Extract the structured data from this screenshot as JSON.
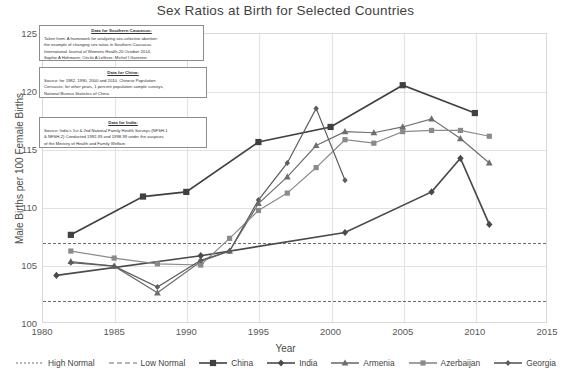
{
  "chart_data": {
    "type": "line",
    "title": "Sex Ratios at Birth for Selected Countries",
    "xlabel": "Year",
    "ylabel": "Male Births per 100 Female Births",
    "xlim": [
      1980,
      2015
    ],
    "ylim": [
      100,
      125
    ],
    "xticks": [
      1980,
      1985,
      1990,
      1995,
      2000,
      2005,
      2010,
      2015
    ],
    "yticks": [
      100,
      105,
      110,
      115,
      120,
      125
    ],
    "grid": true,
    "legend_position": "bottom",
    "reference_lines": [
      {
        "name": "High Normal",
        "value": 107,
        "style": "dotted"
      },
      {
        "name": "Low Normal",
        "value": 102,
        "style": "dashed"
      }
    ],
    "series": [
      {
        "name": "China",
        "marker": "square",
        "color": "#404040",
        "points": [
          {
            "x": 1982,
            "y": 107.6
          },
          {
            "x": 1987,
            "y": 110.9
          },
          {
            "x": 1990,
            "y": 111.3
          },
          {
            "x": 1995,
            "y": 115.6
          },
          {
            "x": 2000,
            "y": 116.9
          },
          {
            "x": 2005,
            "y": 120.5
          },
          {
            "x": 2010,
            "y": 118.1
          }
        ]
      },
      {
        "name": "India",
        "marker": "diamond",
        "color": "#4a4a4a",
        "points": [
          {
            "x": 1981,
            "y": 104.1
          },
          {
            "x": 1991,
            "y": 105.8
          },
          {
            "x": 2001,
            "y": 107.8
          },
          {
            "x": 2007,
            "y": 111.3
          },
          {
            "x": 2009,
            "y": 114.2
          },
          {
            "x": 2011,
            "y": 108.5
          }
        ]
      },
      {
        "name": "Armenia",
        "marker": "triangle",
        "color": "#6e6e6e",
        "points": [
          {
            "x": 1982,
            "y": 105.3
          },
          {
            "x": 1985,
            "y": 104.9
          },
          {
            "x": 1988,
            "y": 102.6
          },
          {
            "x": 1991,
            "y": 105.3
          },
          {
            "x": 1993,
            "y": 106.2
          },
          {
            "x": 1995,
            "y": 110.3
          },
          {
            "x": 1997,
            "y": 112.6
          },
          {
            "x": 1999,
            "y": 115.3
          },
          {
            "x": 2001,
            "y": 116.5
          },
          {
            "x": 2003,
            "y": 116.4
          },
          {
            "x": 2005,
            "y": 116.9
          },
          {
            "x": 2007,
            "y": 117.6
          },
          {
            "x": 2009,
            "y": 115.9
          },
          {
            "x": 2011,
            "y": 113.8
          }
        ]
      },
      {
        "name": "Azerbaijan",
        "marker": "square-small",
        "color": "#8a8a8a",
        "points": [
          {
            "x": 1982,
            "y": 106.2
          },
          {
            "x": 1985,
            "y": 105.6
          },
          {
            "x": 1988,
            "y": 105.1
          },
          {
            "x": 1991,
            "y": 105.0
          },
          {
            "x": 1993,
            "y": 107.3
          },
          {
            "x": 1995,
            "y": 109.7
          },
          {
            "x": 1997,
            "y": 111.2
          },
          {
            "x": 1999,
            "y": 113.4
          },
          {
            "x": 2001,
            "y": 115.8
          },
          {
            "x": 2003,
            "y": 115.5
          },
          {
            "x": 2005,
            "y": 116.5
          },
          {
            "x": 2007,
            "y": 116.6
          },
          {
            "x": 2009,
            "y": 116.6
          },
          {
            "x": 2011,
            "y": 116.1
          }
        ]
      },
      {
        "name": "Georgia",
        "marker": "diamond-small",
        "color": "#5c5c5c",
        "points": [
          {
            "x": 1982,
            "y": 105.2
          },
          {
            "x": 1985,
            "y": 104.9
          },
          {
            "x": 1988,
            "y": 103.1
          },
          {
            "x": 1991,
            "y": 105.4
          },
          {
            "x": 1993,
            "y": 106.2
          },
          {
            "x": 1995,
            "y": 110.6
          },
          {
            "x": 1997,
            "y": 113.8
          },
          {
            "x": 1999,
            "y": 118.5
          },
          {
            "x": 2001,
            "y": 112.3
          }
        ]
      }
    ]
  },
  "notes": [
    {
      "id": "caucasus",
      "title": "Data for Southern Caucasus:",
      "lines": [
        "Taken from: A framework for analyzing sex-selective abortion:",
        "the example of changing sex ratios in Southern Caucasus.",
        "International Journal of Womens Health,20 October 2014,",
        "Sophie A Hohmann; Cécile A Lefèvre; Michel I Garenne."
      ]
    },
    {
      "id": "china",
      "title": "Data for China:",
      "lines": [
        "Source: for 1982, 1990, 2000 and 2010, Chinese Population",
        "Censuses; for other years, 1 percent population sample surveys,",
        "National Bureau Statistics of China."
      ]
    },
    {
      "id": "india",
      "title": "Data for India:",
      "lines": [
        "Source: India's 1st & 2nd National Family Health Surveys (NFSH-1",
        "& NFSH-2) Conducted  1992-93 and 1998-99 under the auspices",
        "of the Ministry of Health and Family Welfare."
      ]
    }
  ]
}
